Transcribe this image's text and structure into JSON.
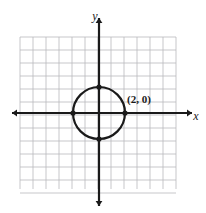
{
  "figure": {
    "name": "circle-on-coordinate-grid",
    "background_color": "#ffffff",
    "grid": {
      "color": "#b9b9bd",
      "line_width": 0.8,
      "cell_size_px": 13,
      "columns": 12,
      "rows": 12,
      "left_px": 20,
      "top_px": 37,
      "right_px": 176,
      "bottom_px": 189
    },
    "axes": {
      "color": "#1a1a1a",
      "line_width": 2.2,
      "origin_px": {
        "x": 99,
        "y": 113
      },
      "x_axis": {
        "start_px": 12,
        "end_px": 192,
        "arrows": "both"
      },
      "y_axis": {
        "start_px": 18,
        "end_px": 206,
        "arrows": "both"
      },
      "x_label": "x",
      "y_label": "y",
      "x_label_pos_px": {
        "x": 196,
        "y": 117
      },
      "y_label_pos_px": {
        "x": 95,
        "y": 17
      }
    },
    "circle": {
      "color": "#1a1a1a",
      "line_width": 2.2,
      "fill": "none",
      "center": {
        "x": 0,
        "y": 0
      },
      "center_px": {
        "x": 99,
        "y": 113
      },
      "radius_units": 2,
      "radius_px": 26
    },
    "points": [
      {
        "label": "",
        "x": 2,
        "y": 0,
        "cx_px": 125,
        "cy_px": 113,
        "r_px": 2.6
      },
      {
        "label": "",
        "x": 0,
        "y": 2,
        "cx_px": 99,
        "cy_px": 87,
        "r_px": 2.6
      },
      {
        "label": "",
        "x": -2,
        "y": 0,
        "cx_px": 73,
        "cy_px": 113,
        "r_px": 2.6
      },
      {
        "label": "",
        "x": 0,
        "y": -2,
        "cx_px": 99,
        "cy_px": 139,
        "r_px": 2.6
      }
    ],
    "annotations": [
      {
        "text": "(2, 0)",
        "x_px": 127,
        "y_px": 103
      }
    ]
  }
}
